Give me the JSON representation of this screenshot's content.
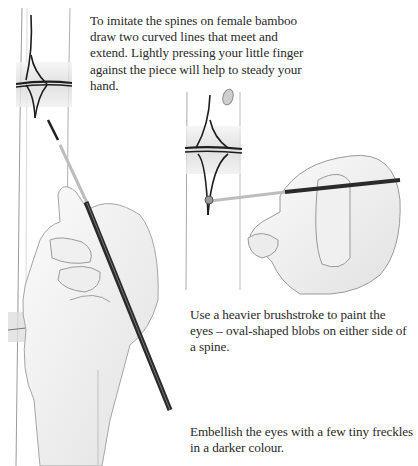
{
  "page": {
    "illustrations": [
      {
        "name": "left-illustration",
        "description": "Hand painting curved spine lines on a bamboo node with a long brush"
      },
      {
        "name": "right-illustration",
        "description": "Hand painting an oval eye blob beside the spine with a brush"
      }
    ],
    "captions": [
      {
        "id": "spines",
        "lines": [
          "To imitate the spines on female bamboo",
          "draw two curved lines that meet and",
          "extend. Lightly pressing your little finger",
          "against the piece will help to steady your",
          "hand."
        ]
      },
      {
        "id": "eyes",
        "lines": [
          "Use a heavier brushstroke to paint the",
          "eyes – oval-shaped blobs on either side of",
          "a spine."
        ]
      },
      {
        "id": "freckles",
        "lines": [
          "Embellish the eyes with a few tiny freckles",
          "in a darker colour."
        ]
      }
    ],
    "colors": {
      "background": "#ffffff",
      "text": "#2a2a2a",
      "ink": "#1e1e1e",
      "pencil": "#8a8a8a",
      "node_band": "#e4e4e4"
    }
  }
}
